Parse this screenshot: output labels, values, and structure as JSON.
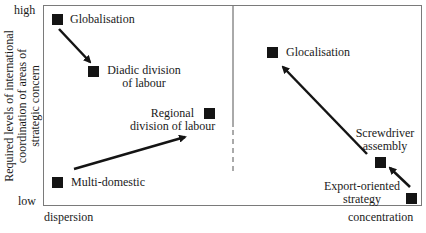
{
  "diagram": {
    "type": "quadrant-strategy-map",
    "y_axis": {
      "title_lines": [
        "Required levels of international",
        "coordination of areas of",
        "strategic concern"
      ],
      "high_label": "high",
      "low_label": "low"
    },
    "x_axis": {
      "left_label": "dispersion",
      "right_label": "concentration"
    },
    "nodes": [
      {
        "id": "globalisation",
        "label_lines": [
          "Globalisation"
        ]
      },
      {
        "id": "diadic",
        "label_lines": [
          "Diadic division",
          "of labour"
        ]
      },
      {
        "id": "regional",
        "label_lines": [
          "Regional",
          "division of labour"
        ]
      },
      {
        "id": "multi-domestic",
        "label_lines": [
          "Multi-domestic"
        ]
      },
      {
        "id": "glocalisation",
        "label_lines": [
          "Glocalisation"
        ]
      },
      {
        "id": "screwdriver",
        "label_lines": [
          "Screwdriver",
          "assembly"
        ]
      },
      {
        "id": "export",
        "label_lines": [
          "Export-oriented",
          "strategy"
        ]
      }
    ],
    "arrows": [
      {
        "from": "globalisation",
        "to": "diadic"
      },
      {
        "from": "multi-domestic",
        "to": "regional"
      },
      {
        "from": "screwdriver",
        "to": "glocalisation"
      },
      {
        "from": "export",
        "to": "screwdriver"
      }
    ],
    "divider": {
      "style": "solid-then-dashed",
      "position": "vertical-center"
    }
  }
}
